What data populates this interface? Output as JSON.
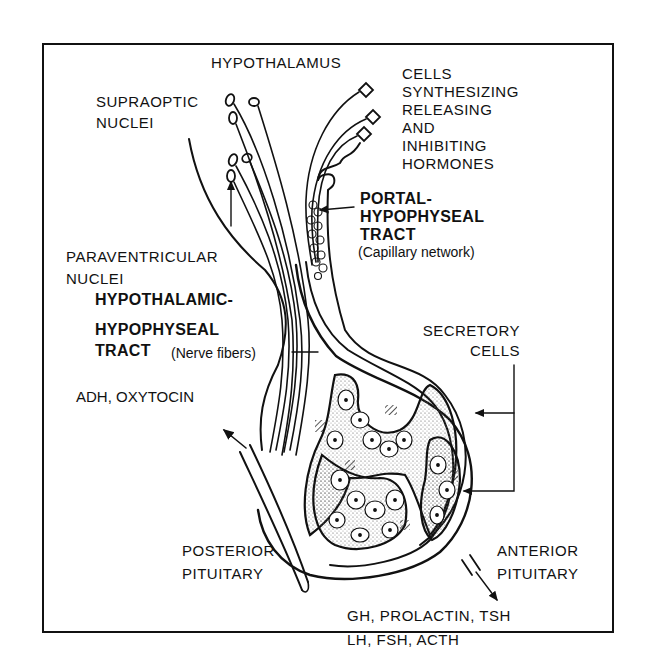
{
  "diagram": {
    "labels": {
      "hypothalamus": "HYPOTHALAMUS",
      "supraoptic": [
        "SUPRAOPTIC",
        "NUCLEI"
      ],
      "cells_synth": [
        "CELLS",
        "SYNTHESIZING",
        "RELEASING",
        "AND",
        "INHIBITING",
        "HORMONES"
      ],
      "portal": [
        "PORTAL-",
        "HYPOPHYSEAL",
        "TRACT"
      ],
      "portal_note": "(Capillary network)",
      "paraventricular": [
        "PARAVENTRICULAR",
        "NUCLEI"
      ],
      "hh_tract": [
        "HYPOTHALAMIC-",
        "HYPOPHYSEAL",
        "TRACT"
      ],
      "hh_note": "(Nerve fibers)",
      "secretory": [
        "SECRETORY",
        "CELLS"
      ],
      "posterior_hormones": "ADH, OXYTOCIN",
      "posterior": [
        "POSTERIOR",
        "PITUITARY"
      ],
      "anterior": [
        "ANTERIOR",
        "PITUITARY"
      ],
      "anterior_hormones": [
        "GH, PROLACTIN, TSH",
        "LH, FSH, ACTH"
      ]
    },
    "colors": {
      "ink": "#111111",
      "background": "#ffffff"
    }
  }
}
